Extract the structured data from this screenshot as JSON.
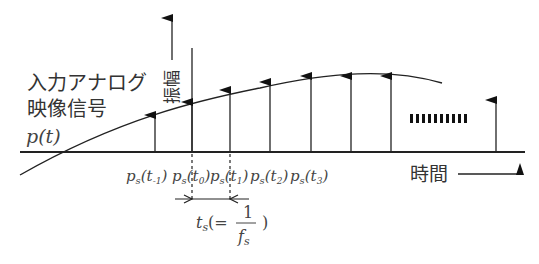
{
  "labels": {
    "signal_title_line1": "入力アナログ",
    "signal_title_line2": "映像信号",
    "signal_symbol": "p(t)",
    "amplitude_axis": "振幅",
    "time_axis": "時間",
    "sample_labels": [
      "p_s(t_-1)",
      "p_s(t_0)",
      "p_s(t_1)",
      "p_s(t_2)",
      "p_s(t_3)"
    ],
    "period_label": "t_s(= 1/f_s)"
  },
  "colors": {
    "line": "#222222",
    "text": "#333333"
  }
}
